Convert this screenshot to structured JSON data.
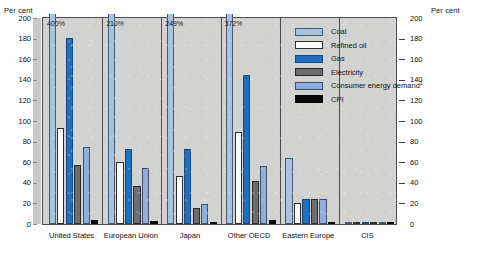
{
  "axis": {
    "left_title": "Per cent",
    "right_title": "Per cent",
    "ticks": [
      200,
      180,
      160,
      140,
      120,
      100,
      80,
      60,
      40,
      20,
      0
    ]
  },
  "legend": {
    "items": [
      {
        "key": "coal",
        "label": "Coal"
      },
      {
        "key": "oil",
        "label": "Refined oil"
      },
      {
        "key": "gas",
        "label": "Gas"
      },
      {
        "key": "elec",
        "label": "Electricity"
      },
      {
        "key": "ced",
        "label": "Consumer energy demand",
        "superscript": "1"
      },
      {
        "key": "cpi",
        "label": "CPI"
      }
    ]
  },
  "chart_data": {
    "type": "bar",
    "title": "",
    "xlabel": "",
    "ylabel": "Per cent",
    "ylim": [
      0,
      200
    ],
    "grid": false,
    "legend_position": "top-right",
    "categories": [
      "United States",
      "European Union",
      "Japan",
      "Other OECD",
      "Eastern Europe",
      "CIS"
    ],
    "series": [
      {
        "name": "Coal",
        "key": "coal",
        "values": [
          400,
          210,
          249,
          372,
          64,
          1
        ]
      },
      {
        "name": "Refined oil",
        "key": "oil",
        "values": [
          93,
          60,
          47,
          89,
          20,
          1
        ]
      },
      {
        "name": "Gas",
        "key": "gas",
        "values": [
          181,
          73,
          73,
          145,
          24,
          1
        ]
      },
      {
        "name": "Electricity",
        "key": "elec",
        "values": [
          57,
          37,
          16,
          42,
          24,
          1
        ]
      },
      {
        "name": "Consumer energy demand",
        "key": "ced",
        "values": [
          75,
          54,
          19,
          56,
          24,
          1
        ]
      },
      {
        "name": "CPI",
        "key": "cpi",
        "values": [
          4,
          3,
          1,
          4,
          2,
          0
        ]
      }
    ],
    "clipped_annotations": [
      {
        "category": "United States",
        "series": "Coal",
        "label": "400%"
      },
      {
        "category": "European Union",
        "series": "Coal",
        "label": "210%"
      },
      {
        "category": "Japan",
        "series": "Coal",
        "label": "249%"
      },
      {
        "category": "Other OECD",
        "series": "Coal",
        "label": "372%"
      }
    ]
  },
  "colors": {
    "coal": "#a8c2e2",
    "oil": "#fbfbfb",
    "gas": "#1f6fc0",
    "electricity": "#6e6e6e",
    "consumer_energy_demand": "#8fb0de",
    "cpi": "#070707",
    "plot_background": "#d2d2d0"
  }
}
